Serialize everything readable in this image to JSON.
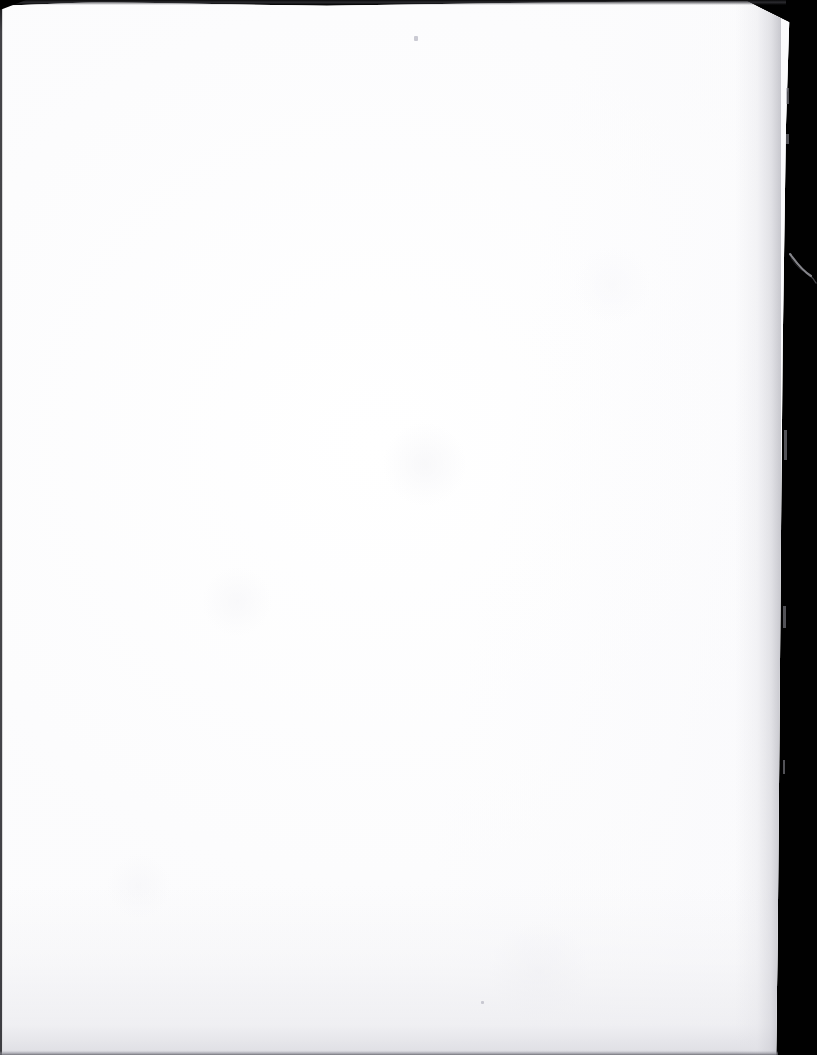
{
  "document": {
    "kind": "scanned-page-image",
    "page_content": "",
    "page_text_visible": "",
    "note": "blank page"
  },
  "canvas": {
    "width": 817,
    "height": 1055
  },
  "colors": {
    "scanner_backdrop": "#010101",
    "paper": "#ffffff",
    "paper_shadow": "#b2b2ba",
    "edge_line": "#141416",
    "smudge": "#eaeaee"
  },
  "regions": {
    "paper_sheet_label": "",
    "right_black_band_label": "",
    "top_black_band_label": ""
  },
  "artifacts": {
    "wisp_label": "",
    "speck_label": "",
    "nick_label": ""
  }
}
